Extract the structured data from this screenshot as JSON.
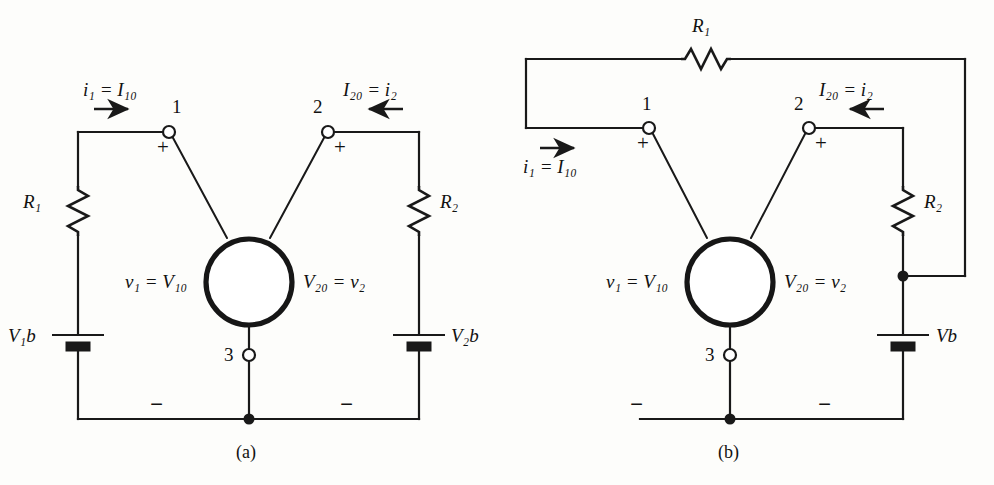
{
  "figure": {
    "type": "circuit-diagram-pair",
    "background_color": "#fdfdfb",
    "line_color": "#191919"
  },
  "panel_a": {
    "caption": "(a)",
    "labels": {
      "current_left": "i₁ = I₁₀",
      "current_right": "I₂₀ = i₂",
      "node1": "1",
      "node2": "2",
      "node3": "3",
      "plus_left": "+",
      "plus_right": "+",
      "minus_left": "−",
      "minus_right": "−",
      "voltage_left": "v₁ = V₁₀",
      "voltage_right": "V₂₀ = v₂",
      "resistor_left": "R₁",
      "resistor_right": "R₂",
      "battery_left": "V₁b",
      "battery_right": "V₂b"
    },
    "components": [
      {
        "name": "resistor-r1",
        "orientation": "vertical",
        "label": "R1"
      },
      {
        "name": "resistor-r2",
        "orientation": "vertical",
        "label": "R2"
      },
      {
        "name": "battery-v1b",
        "orientation": "vertical",
        "label": "V1b"
      },
      {
        "name": "battery-v2b",
        "orientation": "vertical",
        "label": "V2b"
      },
      {
        "name": "device-circle",
        "shape": "circle"
      }
    ],
    "arrows": [
      {
        "name": "current-arrow-left",
        "direction": "right"
      },
      {
        "name": "current-arrow-right",
        "direction": "left"
      }
    ]
  },
  "panel_b": {
    "caption": "(b)",
    "labels": {
      "current_left": "i₁ = I₁₀",
      "current_right": "I₂₀ = i₂",
      "node1": "1",
      "node2": "2",
      "node3": "3",
      "plus_left": "+",
      "plus_right": "+",
      "minus_left": "−",
      "minus_right": "−",
      "voltage_left": "v₁ = V₁₀",
      "voltage_right": "V₂₀ = v₂",
      "resistor_top": "R₁",
      "resistor_right": "R₂",
      "battery": "Vb"
    },
    "components": [
      {
        "name": "resistor-r1",
        "orientation": "horizontal",
        "label": "R1"
      },
      {
        "name": "resistor-r2",
        "orientation": "vertical",
        "label": "R2"
      },
      {
        "name": "battery-vb",
        "orientation": "vertical",
        "label": "Vb"
      },
      {
        "name": "device-circle",
        "shape": "circle"
      }
    ],
    "arrows": [
      {
        "name": "current-arrow-left",
        "direction": "right"
      },
      {
        "name": "current-arrow-right",
        "direction": "left"
      }
    ]
  }
}
